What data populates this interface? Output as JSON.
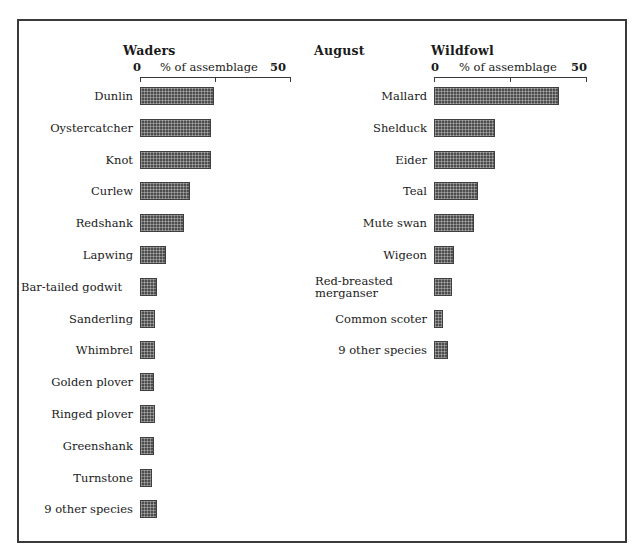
{
  "figure": {
    "month_label": "August",
    "axis_caption": "% of assemblage",
    "axis_min_label": "0",
    "axis_max_label": "50"
  },
  "chart_data": {
    "type": "bar",
    "title": "August",
    "xlabel": "% of assemblage",
    "ylabel": "",
    "xlim": [
      0,
      50
    ],
    "grid": false,
    "legend": "none",
    "orientation": "horizontal",
    "panels": [
      {
        "title": "Waders",
        "xlabel": "% of assemblage",
        "xlim": [
          0,
          50
        ],
        "categories": [
          "Dunlin",
          "Oystercatcher",
          "Knot",
          "Curlew",
          "Redshank",
          "Lapwing",
          "Bar-tailed godwit",
          "Sanderling",
          "Whimbrel",
          "Golden plover",
          "Ringed plover",
          "Greenshank",
          "Turnstone",
          "9 other species"
        ],
        "values": [
          24.5,
          23.5,
          23.5,
          16.5,
          14.5,
          8.5,
          5.5,
          5.0,
          5.0,
          4.5,
          5.0,
          4.5,
          4.0,
          5.5
        ]
      },
      {
        "title": "Wildfowl",
        "xlabel": "% of assemblage",
        "xlim": [
          0,
          50
        ],
        "categories": [
          "Mallard",
          "Shelduck",
          "Eider",
          "Teal",
          "Mute swan",
          "Wigeon",
          "Red-breasted merganser",
          "Common scoter",
          "9 other species"
        ],
        "values": [
          41.0,
          20.0,
          20.0,
          14.5,
          13.0,
          6.5,
          6.0,
          3.0,
          4.5
        ]
      }
    ]
  },
  "waders": {
    "title": "Waders",
    "rows": [
      {
        "label": "Dunlin",
        "value": 24.5,
        "two_line": false
      },
      {
        "label": "Oystercatcher",
        "value": 23.5,
        "two_line": false
      },
      {
        "label": "Knot",
        "value": 23.5,
        "two_line": false
      },
      {
        "label": "Curlew",
        "value": 16.5,
        "two_line": false
      },
      {
        "label": "Redshank",
        "value": 14.5,
        "two_line": false
      },
      {
        "label": "Lapwing",
        "value": 8.5,
        "two_line": false
      },
      {
        "label": "Bar-tailed godwit",
        "value": 5.5,
        "two_line": true
      },
      {
        "label": "Sanderling",
        "value": 5.0,
        "two_line": false
      },
      {
        "label": "Whimbrel",
        "value": 5.0,
        "two_line": false
      },
      {
        "label": "Golden plover",
        "value": 4.5,
        "two_line": false
      },
      {
        "label": "Ringed plover",
        "value": 5.0,
        "two_line": false
      },
      {
        "label": "Greenshank",
        "value": 4.5,
        "two_line": false
      },
      {
        "label": "Turnstone",
        "value": 4.0,
        "two_line": false
      },
      {
        "label": "9 other species",
        "value": 5.5,
        "two_line": false
      }
    ]
  },
  "wildfowl": {
    "title": "Wildfowl",
    "rows": [
      {
        "label": "Mallard",
        "value": 41.0,
        "two_line": false
      },
      {
        "label": "Shelduck",
        "value": 20.0,
        "two_line": false
      },
      {
        "label": "Eider",
        "value": 20.0,
        "two_line": false
      },
      {
        "label": "Teal",
        "value": 14.5,
        "two_line": false
      },
      {
        "label": "Mute swan",
        "value": 13.0,
        "two_line": false
      },
      {
        "label": "Wigeon",
        "value": 6.5,
        "two_line": false
      },
      {
        "label": "Red-breasted merganser",
        "value": 6.0,
        "two_line": true
      },
      {
        "label": "Common scoter",
        "value": 3.0,
        "two_line": false
      },
      {
        "label": "9 other species",
        "value": 4.5,
        "two_line": false
      }
    ]
  }
}
